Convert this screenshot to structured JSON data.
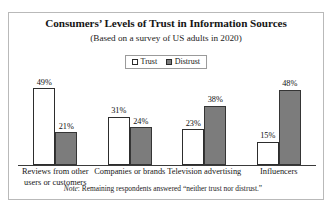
{
  "chart_data": {
    "type": "bar",
    "title": "Consumers’ Levels of Trust in Information Sources",
    "subtitle": "(Based on a survey of US adults in 2020)",
    "xlabel": "",
    "ylabel": "",
    "ylim": [
      0,
      55
    ],
    "grid": false,
    "legend_position": "top-center",
    "categories": [
      "Reviews from other users or customers",
      "Companies or brands",
      "Television advertising",
      "Influencers"
    ],
    "series": [
      {
        "name": "Trust",
        "color": "#ffffff",
        "values": [
          49,
          31,
          23,
          15
        ],
        "labels": [
          "49%",
          "31%",
          "23%",
          "15%"
        ]
      },
      {
        "name": "Distrust",
        "color": "#7c7c7c",
        "values": [
          21,
          24,
          38,
          48
        ],
        "labels": [
          "21%",
          "24%",
          "38%",
          "48%"
        ]
      }
    ],
    "note_lead": "Note",
    "note_text": ": Remaining respondents answered “neither trust nor distrust.”"
  },
  "legend": {
    "items": [
      {
        "label": "Trust",
        "swatch": "white-square-icon"
      },
      {
        "label": "Distrust",
        "swatch": "gray-square-icon"
      }
    ]
  }
}
